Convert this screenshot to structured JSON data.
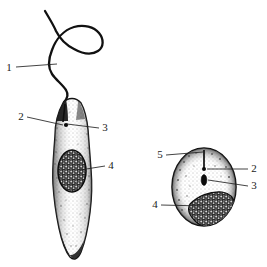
{
  "figure": {
    "background_color": "#ffffff",
    "ink_color": "#111111",
    "label_color": "#1a1a1a"
  },
  "labels": [
    {
      "id": "label-1",
      "text": "1",
      "x": 8,
      "y": 71,
      "leader_to_x": 57,
      "leader_to_y": 64,
      "target": "flagellum"
    },
    {
      "id": "label-2-left",
      "text": "2",
      "x": 20,
      "y": 120,
      "leader_to_x": 62,
      "leader_to_y": 126,
      "target": "flagellar-pocket"
    },
    {
      "id": "label-3-left",
      "text": "3",
      "x": 104,
      "y": 129,
      "leader_to_x": 66,
      "leader_to_y": 124,
      "target": "kinetoplast"
    },
    {
      "id": "label-4-left",
      "text": "4",
      "x": 110,
      "y": 168,
      "leader_to_x": 74,
      "leader_to_y": 172,
      "target": "nucleus"
    },
    {
      "id": "label-5-right",
      "text": "5",
      "x": 160,
      "y": 158,
      "leader_to_x": 204,
      "leader_to_y": 155,
      "target": "amastigote-flagellum-stub"
    },
    {
      "id": "label-2-right",
      "text": "2",
      "x": 253,
      "y": 172,
      "leader_to_x": 206,
      "leader_to_y": 170,
      "target": "amastigote-flagellar-pocket"
    },
    {
      "id": "label-3-right",
      "text": "3",
      "x": 253,
      "y": 189,
      "leader_to_x": 208,
      "leader_to_y": 181,
      "target": "amastigote-kinetoplast"
    },
    {
      "id": "label-4-right",
      "text": "4",
      "x": 155,
      "y": 207,
      "leader_to_x": 203,
      "leader_to_y": 206,
      "target": "amastigote-nucleus"
    }
  ],
  "cells": [
    {
      "name": "promastigote",
      "shape": "elongated-spindle",
      "parts": [
        "flagellum",
        "flagellar-pocket",
        "kinetoplast",
        "nucleus",
        "cell-body"
      ]
    },
    {
      "name": "amastigote",
      "shape": "oval",
      "parts": [
        "flagellum-stub",
        "flagellar-pocket",
        "kinetoplast",
        "nucleus",
        "cell-body"
      ]
    }
  ]
}
